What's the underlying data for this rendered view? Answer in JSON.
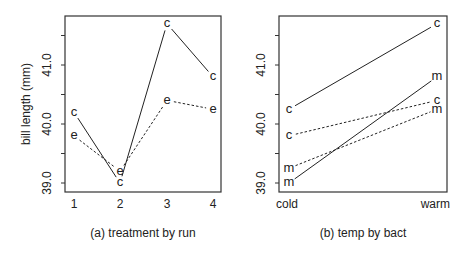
{
  "chart_data": [
    {
      "type": "line",
      "title": "",
      "caption": "(a) treatment by run",
      "xlabel": "",
      "ylabel": "bill length (mm)",
      "categories": [
        "1",
        "2",
        "3",
        "4"
      ],
      "ylim": [
        38.85,
        41.85
      ],
      "yticks": [
        39.0,
        39.5,
        40.0,
        40.5,
        41.0,
        41.5
      ],
      "ytick_labels": [
        "39.0",
        "",
        "40.0",
        "",
        "41.0",
        ""
      ],
      "grid": false,
      "legend": "none (point labels used)",
      "series": [
        {
          "name": "c",
          "label_char": "c",
          "line_style": "solid",
          "values": [
            40.2,
            39.0,
            41.7,
            40.8
          ]
        },
        {
          "name": "e",
          "label_char": "e",
          "line_style": "dotted",
          "values": [
            39.8,
            39.2,
            40.4,
            40.25
          ]
        }
      ]
    },
    {
      "type": "line",
      "title": "",
      "caption": "(b) temp by bact",
      "xlabel": "",
      "ylabel": "",
      "categories": [
        "cold",
        "warm"
      ],
      "ylim": [
        38.85,
        41.85
      ],
      "yticks": [
        39.0,
        39.5,
        40.0,
        40.5,
        41.0,
        41.5
      ],
      "ytick_labels": [
        "39.0",
        "",
        "40.0",
        "",
        "41.0",
        ""
      ],
      "grid": false,
      "legend": "none (point labels used)",
      "series": [
        {
          "name": "c (solid)",
          "label_char": "c",
          "line_style": "solid",
          "values": [
            40.25,
            41.7
          ]
        },
        {
          "name": "m (solid)",
          "label_char": "m",
          "line_style": "solid",
          "values": [
            39.0,
            40.8
          ]
        },
        {
          "name": "c (dotted)",
          "label_char": "c",
          "line_style": "dotted",
          "values": [
            39.8,
            40.4
          ]
        },
        {
          "name": "m (dotted)",
          "label_char": "m",
          "line_style": "dotted",
          "values": [
            39.25,
            40.25
          ]
        }
      ]
    }
  ]
}
